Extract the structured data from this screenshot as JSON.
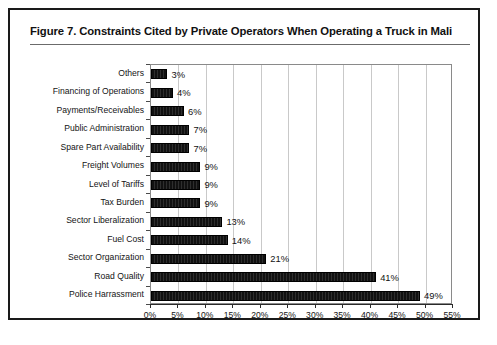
{
  "figure": {
    "title": "Figure 7.  Constraints Cited by Private Operators When Operating a Truck in Mali"
  },
  "chart_data": {
    "type": "bar",
    "orientation": "horizontal",
    "title": "Figure 7.  Constraints Cited by Private Operators When Operating a Truck in Mali",
    "xlabel": "",
    "ylabel": "",
    "xlim": [
      0,
      55
    ],
    "grid": true,
    "legend": null,
    "value_suffix": "%",
    "categories": [
      "Others",
      "Financing of Operations",
      "Payments/Receivables",
      "Public Administration",
      "Spare Part Availability",
      "Freight Volumes",
      "Level of Tariffs",
      "Tax Burden",
      "Sector Liberalization",
      "Fuel Cost",
      "Sector Organization",
      "Road Quality",
      "Police Harrassment"
    ],
    "values": [
      3,
      4,
      6,
      7,
      7,
      9,
      9,
      9,
      13,
      14,
      21,
      41,
      49
    ],
    "data_labels": [
      "3%",
      "4%",
      "6%",
      "7%",
      "7%",
      "9%",
      "9%",
      "9%",
      "13%",
      "14%",
      "21%",
      "41%",
      "49%"
    ],
    "xticks": [
      0,
      5,
      10,
      15,
      20,
      25,
      30,
      35,
      40,
      45,
      50,
      55
    ],
    "xtick_labels": [
      "0%",
      "5%",
      "10%",
      "15%",
      "20%",
      "25%",
      "30%",
      "35%",
      "40%",
      "45%",
      "50%",
      "55%"
    ],
    "bar_color": "#1c1c1c",
    "grid_color": "#c9c9c9",
    "axis_color": "#2a2a2a"
  }
}
